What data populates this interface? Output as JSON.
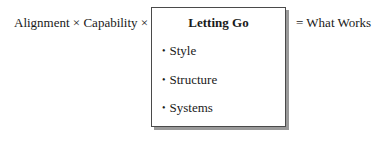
{
  "diagram": {
    "left_expression": "Alignment × Capability ×",
    "box": {
      "title": "Letting Go",
      "items": [
        {
          "bullet": "•",
          "label": "Style"
        },
        {
          "bullet": "•",
          "label": "Structure"
        },
        {
          "bullet": "•",
          "label": "Systems"
        }
      ]
    },
    "right_expression": "= What Works"
  }
}
